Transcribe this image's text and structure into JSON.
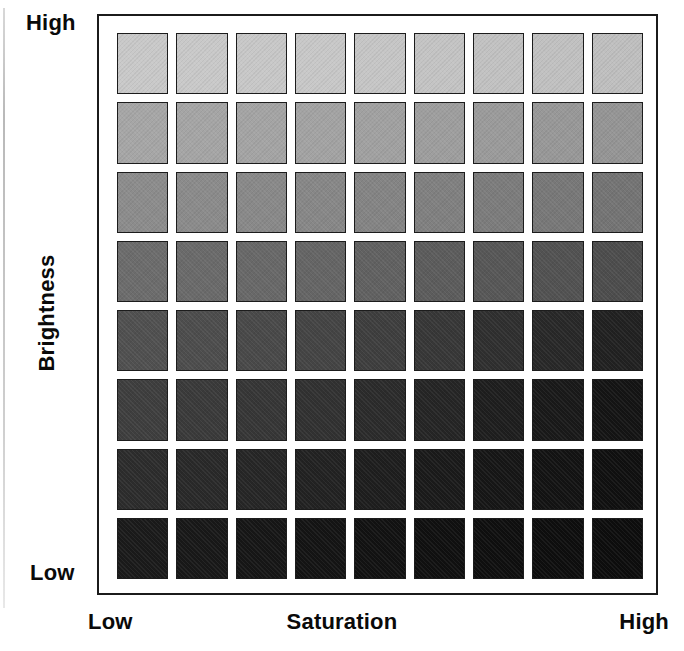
{
  "figure": {
    "type": "grayscale-swatch-matrix"
  },
  "axes": {
    "y": {
      "title": "Brightness",
      "high_label": "High",
      "low_label": "Low",
      "orientation": "vertical",
      "direction": "high-at-top"
    },
    "x": {
      "title": "Saturation",
      "low_label": "Low",
      "high_label": "High",
      "orientation": "horizontal",
      "direction": "low-at-left"
    }
  },
  "chart_data": {
    "type": "heatmap",
    "title": "",
    "xlabel": "Saturation",
    "ylabel": "Brightness",
    "grid": true,
    "legend": "none",
    "columns": 9,
    "rows": 8,
    "x_tick_labels": [
      "Low",
      "",
      "",
      "",
      "",
      "",
      "",
      "",
      "High"
    ],
    "y_tick_labels": [
      "High",
      "",
      "",
      "",
      "",
      "",
      "",
      "Low"
    ],
    "xlim": [
      0,
      9
    ],
    "ylim": [
      0,
      8
    ],
    "value_unit": "grey-level (0-255)",
    "values": [
      [
        201,
        201,
        200,
        200,
        198,
        196,
        194,
        193,
        191
      ],
      [
        166,
        165,
        164,
        163,
        161,
        158,
        155,
        152,
        149
      ],
      [
        140,
        139,
        137,
        135,
        132,
        128,
        124,
        120,
        116
      ],
      [
        108,
        106,
        104,
        101,
        97,
        92,
        87,
        82,
        77
      ],
      [
        80,
        77,
        73,
        68,
        62,
        55,
        47,
        40,
        33
      ],
      [
        62,
        58,
        54,
        49,
        43,
        37,
        30,
        25,
        20
      ],
      [
        44,
        41,
        38,
        34,
        30,
        26,
        22,
        19,
        16
      ],
      [
        26,
        24,
        22,
        20,
        18,
        16,
        15,
        14,
        13
      ]
    ],
    "colors": [
      [
        "#c9c9c9",
        "#c9c9c9",
        "#c8c8c8",
        "#c8c8c8",
        "#c6c6c6",
        "#c4c4c4",
        "#c2c2c2",
        "#c1c1c1",
        "#bfbfbf"
      ],
      [
        "#a6a6a6",
        "#a5a5a5",
        "#a4a4a4",
        "#a3a3a3",
        "#a1a1a1",
        "#9e9e9e",
        "#9b9b9b",
        "#989898",
        "#959595"
      ],
      [
        "#8c8c8c",
        "#8b8b8b",
        "#898989",
        "#878787",
        "#848484",
        "#808080",
        "#7c7c7c",
        "#787878",
        "#747474"
      ],
      [
        "#6c6c6c",
        "#6a6a6a",
        "#686868",
        "#656565",
        "#616161",
        "#5c5c5c",
        "#575757",
        "#525252",
        "#4d4d4d"
      ],
      [
        "#505050",
        "#4d4d4d",
        "#494949",
        "#444444",
        "#3e3e3e",
        "#373737",
        "#2f2f2f",
        "#282828",
        "#212121"
      ],
      [
        "#3e3e3e",
        "#3a3a3a",
        "#363636",
        "#313131",
        "#2b2b2b",
        "#252525",
        "#1e1e1e",
        "#191919",
        "#141414"
      ],
      [
        "#2c2c2c",
        "#292929",
        "#262626",
        "#222222",
        "#1e1e1e",
        "#1a1a1a",
        "#161616",
        "#131313",
        "#101010"
      ],
      [
        "#1a1a1a",
        "#181818",
        "#161616",
        "#141414",
        "#121212",
        "#101010",
        "#0f0f0f",
        "#0e0e0e",
        "#0d0d0d"
      ]
    ]
  },
  "style": {
    "frame_color": "#1b1b1b",
    "swatch_border_color": "#1c1c1c",
    "background": "#ffffff",
    "text_color": "#0a0a0a"
  }
}
